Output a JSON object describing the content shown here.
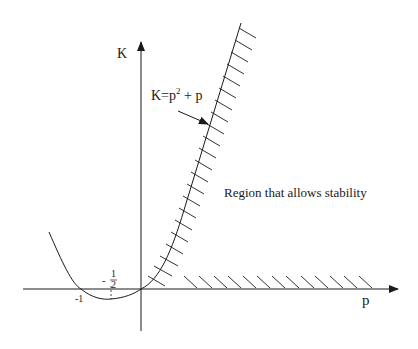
{
  "diagram": {
    "axes": {
      "y_label": "K",
      "x_label": "p"
    },
    "tick_labels": {
      "minus_one": "-1",
      "minus_sign": "-",
      "half_num": "1",
      "half_den": "2"
    },
    "curve_label": {
      "base": "K=p",
      "exp": "2",
      "tail": " + p"
    },
    "region_label": "Region that allows stability",
    "colors": {
      "ink": "#1a1a1a",
      "background": "#ffffff"
    }
  }
}
